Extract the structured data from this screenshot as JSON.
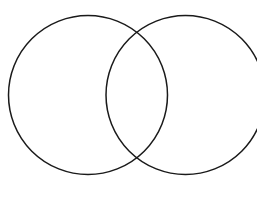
{
  "canvas": {
    "width": 257,
    "height": 197,
    "background_color": "#ffffff",
    "title": "Two-circle Venn diagram outline"
  },
  "diagram": {
    "type": "venn",
    "set_count": 2,
    "fill": "none",
    "stroke_color": "#1a1a1a",
    "stroke_width": 1.5,
    "circles": [
      {
        "id": "left-circle",
        "label": "",
        "cx": 88,
        "cy": 95,
        "r": 79.5,
        "leftmost_x": 8.5,
        "rightmost_x": 167.5,
        "topmost_y": 15.5,
        "bottommost_y": 174.5,
        "clipped": false
      },
      {
        "id": "right-circle",
        "label": "",
        "cx": 185.5,
        "cy": 95,
        "r": 79.5,
        "leftmost_x": 106,
        "rightmost_x": 265,
        "topmost_y": 15.5,
        "bottommost_y": 174.5,
        "clipped": true
      }
    ],
    "intersections": [
      {
        "id": "upper-intersection",
        "x": 136.75,
        "y": 32
      },
      {
        "id": "lower-intersection",
        "x": 136.75,
        "y": 158
      }
    ],
    "regions": [
      {
        "id": "left-only-region",
        "label": ""
      },
      {
        "id": "overlap-region",
        "label": ""
      },
      {
        "id": "right-only-region",
        "label": ""
      }
    ]
  }
}
